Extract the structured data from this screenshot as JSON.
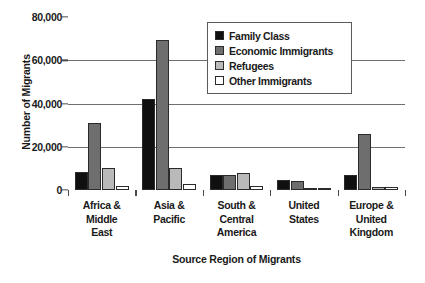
{
  "chart_data": {
    "type": "bar",
    "title": "",
    "xlabel": "Source Region of Migrants",
    "ylabel": "Number of Migrants",
    "ylim": [
      0,
      80000
    ],
    "yticks": [
      0,
      20000,
      40000,
      60000,
      80000
    ],
    "ytick_labels": [
      "0",
      "20,000",
      "40,000",
      "60,000",
      "80,000"
    ],
    "grid": true,
    "legend_position": "top-right-inside",
    "categories": [
      "Africa & Middle East",
      "Asia & Pacific",
      "South & Central America",
      "United States",
      "Europe & United Kingdom"
    ],
    "category_lines": [
      [
        "Africa &",
        "Middle",
        "East"
      ],
      [
        "Asia &",
        "Pacific"
      ],
      [
        "South &",
        "Central",
        "America"
      ],
      [
        "United",
        "States"
      ],
      [
        "Europe &",
        "United",
        "Kingdom"
      ]
    ],
    "series": [
      {
        "name": "Family Class",
        "color": "#101010",
        "values": [
          8500,
          42000,
          7000,
          4500,
          7000
        ]
      },
      {
        "name": "Economic Immigrants",
        "color": "#6e6e6e",
        "values": [
          31000,
          69500,
          7000,
          4000,
          26000
        ]
      },
      {
        "name": "Refugees",
        "color": "#b9b9b9",
        "values": [
          10000,
          10000,
          8000,
          800,
          1500
        ]
      },
      {
        "name": "Other Immigrants",
        "color": "#ffffff",
        "values": [
          2000,
          3000,
          2000,
          500,
          1200
        ]
      }
    ]
  },
  "legend": {
    "items": [
      {
        "label": "Family Class"
      },
      {
        "label": "Economic Immigrants"
      },
      {
        "label": "Refugees"
      },
      {
        "label": "Other Immigrants"
      }
    ]
  }
}
